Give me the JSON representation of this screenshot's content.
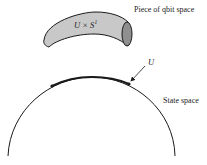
{
  "diagram": {
    "labels": {
      "qbit_space": "Piece of qbit space",
      "tube": "U × S¹",
      "tube_base": "U × S",
      "tube_sup": "1",
      "u": "U",
      "state_space": "State space"
    },
    "colors": {
      "tube_fill": "#c8c8c8",
      "tube_end": "#8f8f8f",
      "stroke": "#1a1a1a",
      "text": "#222222"
    }
  }
}
